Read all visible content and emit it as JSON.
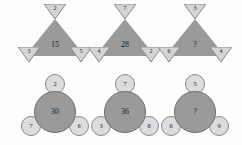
{
  "puzzle": {
    "background_color": "#fdfdfd",
    "big_shape_color": "#9a9a9a",
    "small_shape_color": "#dcdcdc",
    "text_color": "#1c1c1c",
    "rows": [
      {
        "row_name": "triangle-row",
        "shape": "triangle",
        "groups": [
          {
            "center": "15",
            "top": "2",
            "bottom_left": "3",
            "bottom_right": "5"
          },
          {
            "center": "28",
            "top": "7",
            "bottom_left": "4",
            "bottom_right": "2"
          },
          {
            "center": "?",
            "top": "3",
            "bottom_left": "6",
            "bottom_right": "4"
          }
        ]
      },
      {
        "row_name": "circle-row",
        "shape": "circle",
        "groups": [
          {
            "center": "30",
            "top": "2",
            "bottom_left": "7",
            "bottom_right": "6"
          },
          {
            "center": "36",
            "top": "7",
            "bottom_left": "3",
            "bottom_right": "8"
          },
          {
            "center": "?",
            "top": "5",
            "bottom_left": "6",
            "bottom_right": "9"
          }
        ]
      }
    ]
  }
}
